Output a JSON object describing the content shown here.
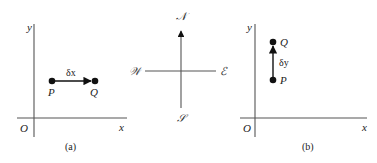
{
  "panel_a": {
    "axis_y_label": "y",
    "axis_x_label": "x",
    "origin_label": "O",
    "point_start_label": "P",
    "point_end_label": "Q",
    "vector_label": "δx",
    "caption": "(a)"
  },
  "compass": {
    "north": "𝒩",
    "south": "𝒮",
    "east": "ℰ",
    "west": "𝒲"
  },
  "panel_b": {
    "axis_y_label": "y",
    "axis_x_label": "x",
    "origin_label": "O",
    "point_start_label": "P",
    "point_end_label": "Q",
    "vector_label": "δy",
    "caption": "(b)"
  }
}
